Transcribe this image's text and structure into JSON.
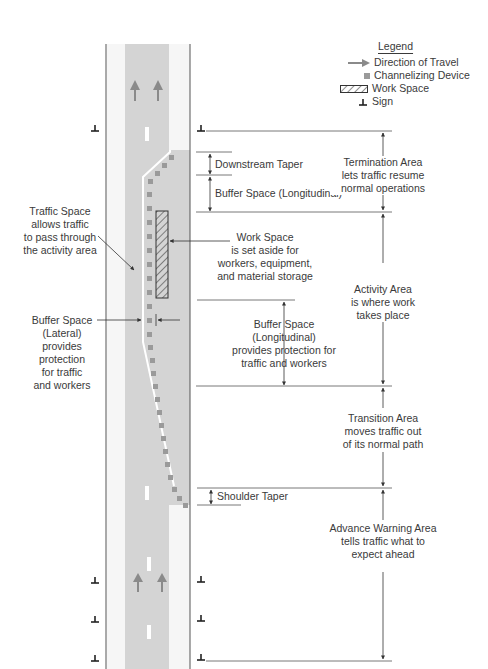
{
  "colors": {
    "road": "#d4d4d4",
    "shoulder_edge": "#f6f6f6",
    "line": "#4a4a4a",
    "device": "#9a9a9a",
    "arrow": "#8a8a8a",
    "text": "#3a3a3a"
  },
  "legend": {
    "title": "Legend",
    "items": [
      {
        "icon": "arrow-right-icon",
        "label": "Direction of Travel"
      },
      {
        "icon": "square-icon",
        "label": "Channelizing Device"
      },
      {
        "icon": "hatched-rect-icon",
        "label": "Work Space"
      },
      {
        "icon": "sign-icon",
        "label": "Sign"
      }
    ]
  },
  "left_labels": {
    "traffic_space": [
      "Traffic Space",
      "allows traffic",
      "to pass through",
      "the activity area"
    ],
    "buffer_lateral": [
      "Buffer Space",
      "(Lateral)",
      "provides",
      "protection",
      "for traffic",
      "and workers"
    ]
  },
  "middle_labels": {
    "downstream_taper": "Downstream Taper",
    "buffer_longitudinal_top": "Buffer Space (Longitudinal)",
    "work_space": [
      "Work Space",
      "is set aside for",
      "workers, equipment,",
      "and material storage"
    ],
    "buffer_longitudinal": [
      "Buffer Space",
      "(Longitudinal)",
      "provides protection for",
      "traffic and workers"
    ],
    "shoulder_taper": "Shoulder Taper"
  },
  "right_labels": {
    "termination": [
      "Termination Area",
      "lets traffic resume",
      "normal operations"
    ],
    "activity": [
      "Activity Area",
      "is where work",
      "takes place"
    ],
    "transition": [
      "Transition Area",
      "moves traffic out",
      "of its normal path"
    ],
    "advance_warning": [
      "Advance Warning Area",
      "tells traffic what to",
      "expect ahead"
    ]
  }
}
